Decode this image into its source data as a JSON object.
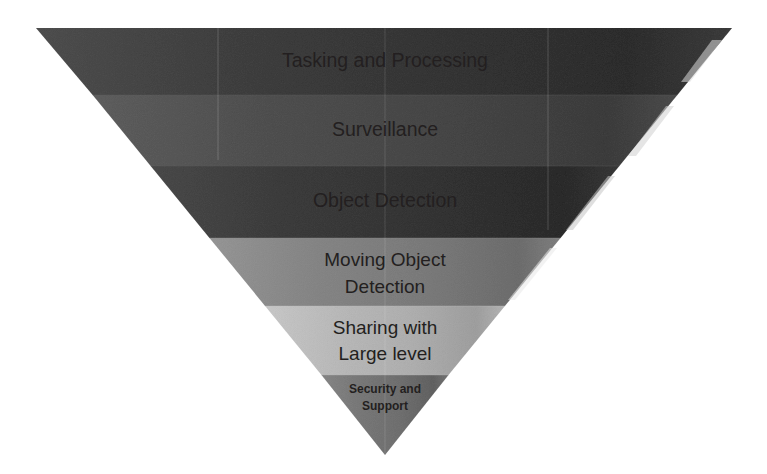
{
  "diagram": {
    "type": "inverted-funnel",
    "title": "",
    "background_color": "#ffffff",
    "text_color": "#231f20",
    "geometry": {
      "top_left_x": 35,
      "top_right_x": 733,
      "top_y": 28,
      "apex_x": 385,
      "apex_y": 455
    },
    "bands": [
      {
        "label": "Tasking and Processing",
        "lines": [
          "Tasking and Processing"
        ],
        "color": "#7b7b7b",
        "color_dark": "#6e6e6e",
        "y_top": 28,
        "y_bottom": 95,
        "level": 1
      },
      {
        "label": "Surveillance",
        "lines": [
          "Surveillance"
        ],
        "color": "#8a8a8a",
        "color_dark": "#7d7d7d",
        "y_top": 95,
        "y_bottom": 166,
        "level": 2
      },
      {
        "label": "Object Detection",
        "lines": [
          "Object Detection"
        ],
        "color": "#777777",
        "color_dark": "#6a6a6a",
        "y_top": 166,
        "y_bottom": 238,
        "level": 3
      },
      {
        "label": "Moving Object Detection",
        "lines": [
          "Moving Object",
          "Detection"
        ],
        "color": "#b5b5b5",
        "color_dark": "#a7a7a7",
        "y_top": 238,
        "y_bottom": 306,
        "level": 4
      },
      {
        "label": "Sharing with Large level",
        "lines": [
          "Sharing with",
          "Large level"
        ],
        "color": "#d8d8d8",
        "color_dark": "#cacaca",
        "y_top": 306,
        "y_bottom": 375,
        "level": 5
      },
      {
        "label": "Security and Support",
        "lines": [
          "Security and",
          "Support"
        ],
        "color": "#adadad",
        "color_dark": "#9f9f9f",
        "y_top": 375,
        "y_bottom": 455,
        "level": 6
      }
    ]
  }
}
